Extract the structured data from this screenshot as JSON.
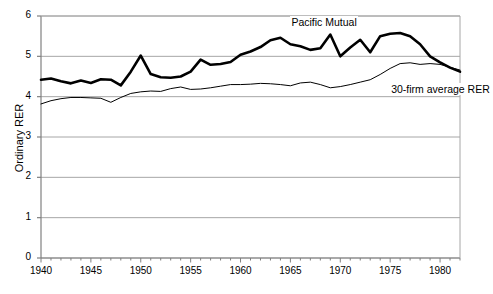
{
  "chart_data": {
    "type": "line",
    "title": "",
    "xlabel": "",
    "ylabel": "Ordinary RER",
    "xlim": [
      1940,
      1982
    ],
    "ylim": [
      0,
      6
    ],
    "yticks": [
      0,
      1,
      2,
      3,
      4,
      5,
      6
    ],
    "ytick_labels": [
      "0",
      "1",
      "2",
      "3",
      "4",
      "5",
      "6"
    ],
    "xticks": [
      1940,
      1945,
      1950,
      1955,
      1960,
      1965,
      1970,
      1975,
      1980
    ],
    "xtick_labels": [
      "1940",
      "1945",
      "1950",
      "1955",
      "1960",
      "1965",
      "1970",
      "1975",
      "1980"
    ],
    "grid": "horizontal",
    "legend_position": "inline-annotations",
    "x": [
      1940,
      1941,
      1942,
      1943,
      1944,
      1945,
      1946,
      1947,
      1948,
      1949,
      1950,
      1951,
      1952,
      1953,
      1954,
      1955,
      1956,
      1957,
      1958,
      1959,
      1960,
      1961,
      1962,
      1963,
      1964,
      1965,
      1966,
      1967,
      1968,
      1969,
      1970,
      1971,
      1972,
      1973,
      1974,
      1975,
      1976,
      1977,
      1978,
      1979,
      1980,
      1981,
      1982
    ],
    "series": [
      {
        "name": "Pacific Mutual",
        "style": "thick-black-line",
        "color": "#000000",
        "values": [
          4.42,
          4.45,
          4.38,
          4.33,
          4.4,
          4.34,
          4.43,
          4.42,
          4.28,
          4.62,
          5.02,
          4.56,
          4.48,
          4.47,
          4.5,
          4.62,
          4.92,
          4.79,
          4.81,
          4.86,
          5.04,
          5.12,
          5.23,
          5.4,
          5.46,
          5.3,
          5.25,
          5.16,
          5.2,
          5.54,
          5.0,
          5.22,
          5.41,
          5.1,
          5.5,
          5.56,
          5.58,
          5.5,
          5.3,
          5.0,
          4.85,
          4.72,
          4.62
        ]
      },
      {
        "name": "30-firm average RER",
        "style": "thin-black-line",
        "color": "#000000",
        "values": [
          3.82,
          3.9,
          3.95,
          3.98,
          3.98,
          3.97,
          3.96,
          3.86,
          3.98,
          4.08,
          4.12,
          4.14,
          4.13,
          4.2,
          4.24,
          4.18,
          4.19,
          4.22,
          4.26,
          4.3,
          4.3,
          4.31,
          4.33,
          4.32,
          4.3,
          4.27,
          4.34,
          4.36,
          4.3,
          4.22,
          4.25,
          4.3,
          4.36,
          4.42,
          4.55,
          4.7,
          4.82,
          4.84,
          4.8,
          4.82,
          4.8,
          4.73,
          4.66
        ]
      }
    ],
    "annotations": [
      {
        "text": "Pacific Mutual",
        "x": 1965,
        "y": 5.82
      },
      {
        "text": "30-firm average RER",
        "x": 1975,
        "y": 4.16
      }
    ]
  },
  "plot": {
    "background": "#ffffff",
    "grid_color": "#a6a6a6",
    "axis_color": "#808080",
    "thick_line_width": 2.6,
    "thin_line_width": 1.0
  }
}
